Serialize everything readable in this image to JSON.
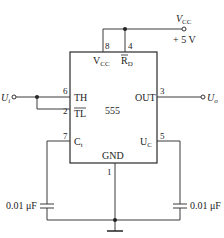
{
  "diagram": {
    "chip": {
      "name": "555",
      "pins": [
        {
          "number": "8",
          "label": "V",
          "label_sub": "CC"
        },
        {
          "number": "4",
          "label": "R",
          "label_sub": "D",
          "overline": true
        },
        {
          "number": "6",
          "label": "TH"
        },
        {
          "number": "2",
          "label": "TL",
          "overline": true
        },
        {
          "number": "3",
          "label": "OUT"
        },
        {
          "number": "7",
          "label": "C",
          "label_sub": "t"
        },
        {
          "number": "5",
          "label": "U",
          "label_sub": "C"
        },
        {
          "number": "1",
          "label": "GND"
        }
      ]
    },
    "supply": {
      "label": "V",
      "label_sub": "CC",
      "value": "+ 5 V"
    },
    "input": {
      "label": "U",
      "label_sub": "i"
    },
    "output": {
      "label": "U",
      "label_sub": "o"
    },
    "capacitors": [
      {
        "position": "left",
        "value": "0.01 μF"
      },
      {
        "position": "right",
        "value": "0.01 μF"
      }
    ],
    "ground": "ground"
  }
}
